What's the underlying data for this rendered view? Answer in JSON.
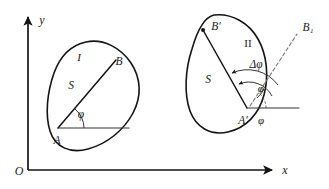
{
  "figure": {
    "axes": {
      "origin_label": "O",
      "x_label": "x",
      "y_label": "y"
    },
    "position_one": {
      "region_label": "I",
      "area_label": "S",
      "start_point_label": "A",
      "end_point_label": "B",
      "angle_label": "φ"
    },
    "position_two": {
      "region_label": "II",
      "area_label": "S",
      "start_point_label": "A′",
      "end_point_label": "B′",
      "reference_point_label": "B₁",
      "angle_label": "φ",
      "angle_prime_label": "φ′",
      "delta_angle_label": "Δφ"
    },
    "colors": {
      "ink": "#141414",
      "thin_ink": "#333333",
      "dashed": "#777777",
      "background": "#ffffff"
    }
  }
}
